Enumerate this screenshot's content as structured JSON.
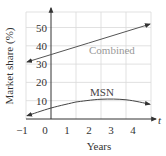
{
  "chart_data": {
    "type": "line",
    "title": "",
    "xlabel": "Years",
    "ylabel": "Market share (%)",
    "x_axis_symbol": "t",
    "xlim": [
      -1,
      4.9
    ],
    "ylim": [
      0,
      58
    ],
    "x_ticks": [
      "−1",
      "0",
      "1",
      "2",
      "3",
      "4"
    ],
    "y_ticks": [
      "10",
      "20",
      "30",
      "40",
      "50"
    ],
    "grid": true,
    "x": [
      -1,
      0,
      1,
      2,
      3,
      4
    ],
    "series": [
      {
        "name": "Combined",
        "values": [
          31,
          35.2,
          39.4,
          43.6,
          47.8,
          52
        ],
        "color": "#555555",
        "label_color": "#999999"
      },
      {
        "name": "MSN",
        "values": [
          1.5,
          6,
          9.3,
          10.8,
          10.5,
          8
        ],
        "color": "#444444",
        "label_color": "#444444"
      }
    ]
  }
}
